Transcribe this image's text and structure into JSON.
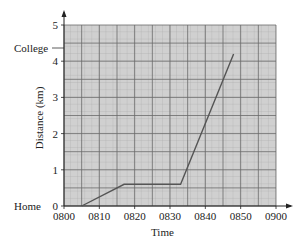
{
  "chart_data": {
    "type": "line",
    "title": "",
    "xlabel": "Time",
    "ylabel": "Distance (km)",
    "x_ticks": [
      "0800",
      "0810",
      "0820",
      "0830",
      "0840",
      "0850",
      "0900"
    ],
    "y_ticks": [
      "0",
      "1",
      "2",
      "3",
      "4",
      "5"
    ],
    "xlim": [
      "0800",
      "0900"
    ],
    "ylim": [
      0,
      5
    ],
    "grid": true,
    "annotations": [
      {
        "label": "Home",
        "y": 0
      },
      {
        "label": "College",
        "y": 4.2
      }
    ],
    "series": [
      {
        "name": "Journey",
        "x": [
          "0805",
          "0817",
          "0833",
          "0848"
        ],
        "y": [
          0,
          0.6,
          0.6,
          4.2
        ]
      }
    ]
  },
  "labels": {
    "xlabel": "Time",
    "ylabel": "Distance (km)",
    "home": "Home",
    "college": "College"
  }
}
